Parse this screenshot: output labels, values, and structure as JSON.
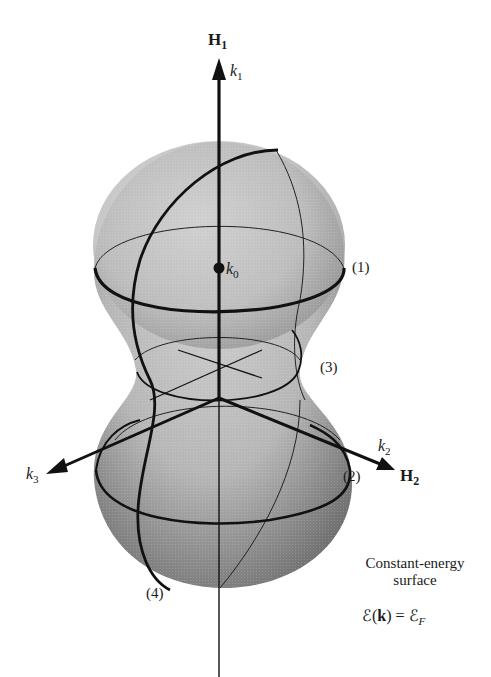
{
  "figure": {
    "type": "3D constant-energy surface diagram (dumbbell-shaped Fermi surface)",
    "axes": {
      "vertical": {
        "field_label": "H",
        "field_sub": "1",
        "k_label": "k",
        "k_sub": "1"
      },
      "right": {
        "field_label": "H",
        "field_sub": "2",
        "k_label": "k",
        "k_sub": "2"
      },
      "left": {
        "k_label": "k",
        "k_sub": "3"
      }
    },
    "center_point": {
      "label": "k",
      "sub": "0"
    },
    "orbits": [
      {
        "id": "1",
        "label": "(1)"
      },
      {
        "id": "2",
        "label": "(2)"
      },
      {
        "id": "3",
        "label": "(3)"
      },
      {
        "id": "4",
        "label": "(4)"
      }
    ],
    "caption": {
      "line1": "Constant-energy",
      "line2": "surface",
      "equation_lhs_symbol": "ℰ",
      "equation_arg": "k",
      "equation_rhs_symbol": "ℰ",
      "equation_rhs_sub": "F"
    },
    "colors": {
      "surface_fill": "#b8b8b8",
      "surface_shadow": "#7a7a7a",
      "lines": "#111111",
      "background": "#ffffff"
    }
  }
}
